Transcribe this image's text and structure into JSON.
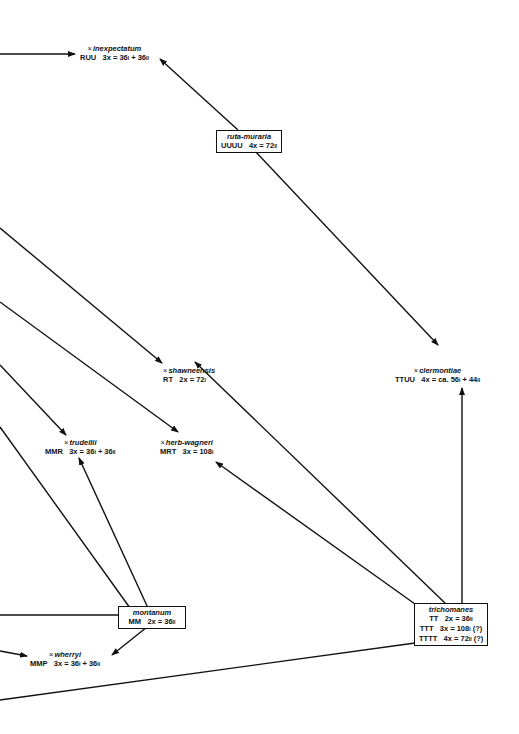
{
  "diagram": {
    "type": "hybridization network",
    "nodes": [
      {
        "id": "inexpectatum",
        "hybrid": true,
        "name": "inexpectatum",
        "genome": "RUU",
        "formula": "3x = 36I + 36II",
        "boxed": false
      },
      {
        "id": "ruta-muraria",
        "hybrid": false,
        "name": "ruta-muraria",
        "genome": "UUUU",
        "formula": "4x = 72II",
        "boxed": true
      },
      {
        "id": "shawneensis",
        "hybrid": true,
        "name": "shawneensis",
        "genome": "RT",
        "formula": "2x = 72I",
        "boxed": false
      },
      {
        "id": "clermontiae",
        "hybrid": true,
        "name": "clermontiae",
        "genome": "TTUU",
        "formula": "4x = ca. 56I + 44II",
        "boxed": false
      },
      {
        "id": "trudellii",
        "hybrid": true,
        "name": "trudellii",
        "genome": "MMR",
        "formula": "3x = 36I + 36II",
        "boxed": false
      },
      {
        "id": "herb-wagneri",
        "hybrid": true,
        "name": "herb-wagneri",
        "genome": "MRT",
        "formula": "3x = 108I",
        "boxed": false
      },
      {
        "id": "montanum",
        "hybrid": false,
        "name": "montanum",
        "genome": "MM",
        "formula": "2x = 36II",
        "boxed": true
      },
      {
        "id": "wherryi",
        "hybrid": true,
        "name": "wherryi",
        "genome": "MMP",
        "formula": "3x = 36I + 36II",
        "boxed": false
      },
      {
        "id": "trichomanes",
        "hybrid": false,
        "name": "trichomanes",
        "boxed": true,
        "rows": [
          {
            "genome": "TT",
            "formula": "2x = 36II"
          },
          {
            "genome": "TTT",
            "formula": "3x = 108I (?)"
          },
          {
            "genome": "TTTT",
            "formula": "4x = 72II (?)"
          }
        ]
      }
    ],
    "cross_symbol": "×",
    "edges": [
      {
        "from": "left-edge",
        "to": "inexpectatum"
      },
      {
        "from": "ruta-muraria",
        "to": "inexpectatum"
      },
      {
        "from": "ruta-muraria",
        "to": "clermontiae"
      },
      {
        "from": "left-edge",
        "to": "shawneensis"
      },
      {
        "from": "left-edge",
        "to": "herb-wagneri"
      },
      {
        "from": "left-edge",
        "to": "trudellii"
      },
      {
        "from": "left-edge",
        "to": "montanum"
      },
      {
        "from": "montanum",
        "to": "trudellii"
      },
      {
        "from": "montanum",
        "to": "wherryi"
      },
      {
        "from": "left-edge",
        "to": "wherryi"
      },
      {
        "from": "trichomanes",
        "to": "shawneensis"
      },
      {
        "from": "trichomanes",
        "to": "herb-wagneri"
      },
      {
        "from": "trichomanes",
        "to": "clermontiae"
      },
      {
        "from": "trichomanes",
        "to": "left-edge"
      }
    ]
  },
  "labels": {
    "x": "×",
    "inexpectatum": {
      "name": "inexpectatum",
      "genome": "RUU",
      "f1": "3x = 36",
      "s1": "I",
      "f2": " + 36",
      "s2": "II"
    },
    "ruta": {
      "name": "ruta-muraria",
      "genome": "UUUU",
      "f1": "4x = 72",
      "s1": "II"
    },
    "shawneensis": {
      "name": "shawneensis",
      "genome": "RT",
      "f1": "2x = 72",
      "s1": "I"
    },
    "clermontiae": {
      "name": "clermontiae",
      "genome": "TTUU",
      "f1": "4x = ca. 56",
      "s1": "I",
      "f2": " + 44",
      "s2": "II"
    },
    "trudellii": {
      "name": "trudellii",
      "genome": "MMR",
      "f1": "3x = 36",
      "s1": "I",
      "f2": " + 36",
      "s2": "II"
    },
    "herbwagneri": {
      "name": "herb-wagneri",
      "genome": "MRT",
      "f1": "3x = 108",
      "s1": "I"
    },
    "montanum": {
      "name": "montanum",
      "genome": "MM",
      "f1": "2x = 36",
      "s1": "II"
    },
    "wherryi": {
      "name": "wherryi",
      "genome": "MMP",
      "f1": "3x = 36",
      "s1": "I",
      "f2": " + 36",
      "s2": "II"
    },
    "trichomanes": {
      "name": "trichomanes",
      "r1g": "TT",
      "r1f": "2x = 36",
      "r1s": "II",
      "r1q": "",
      "r2g": "TTT",
      "r2f": "3x = 108",
      "r2s": "I",
      "r2q": " (?)",
      "r3g": "TTTT",
      "r3f": "4x = 72",
      "r3s": "II",
      "r3q": " (?)"
    }
  }
}
